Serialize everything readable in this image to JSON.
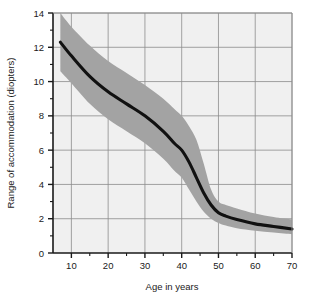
{
  "chart_data": {
    "type": "line",
    "title": "",
    "xlabel": "Age in years",
    "ylabel": "Range of accommodation (diopters)",
    "xlim": [
      5,
      70
    ],
    "ylim": [
      0,
      14
    ],
    "xticks": [
      10,
      20,
      30,
      40,
      50,
      60,
      70
    ],
    "xtick_labels": [
      "10",
      "20",
      "30",
      "40",
      "50",
      "60",
      "70"
    ],
    "xminor_ticks": [
      15,
      25,
      35,
      45,
      55,
      65
    ],
    "yticks": [
      0,
      2,
      4,
      6,
      8,
      10,
      12,
      14
    ],
    "ytick_labels": [
      "0",
      "2",
      "4",
      "6",
      "8",
      "10",
      "12",
      "14"
    ],
    "yminor_ticks": [
      1,
      3,
      5,
      7,
      9,
      11,
      13
    ],
    "grid": true,
    "legend": null,
    "series": [
      {
        "name": "Mean range of accommodation",
        "x": [
          7,
          10,
          15,
          20,
          25,
          30,
          35,
          38,
          40,
          42,
          44,
          46,
          48,
          50,
          52,
          55,
          60,
          65,
          70
        ],
        "values": [
          12.3,
          11.5,
          10.3,
          9.4,
          8.7,
          8.0,
          7.1,
          6.4,
          6.0,
          5.3,
          4.4,
          3.5,
          2.8,
          2.35,
          2.15,
          1.95,
          1.7,
          1.55,
          1.4
        ]
      }
    ],
    "band": {
      "name": "Range of normal variation",
      "x": [
        7,
        10,
        15,
        20,
        25,
        30,
        35,
        38,
        40,
        42,
        44,
        46,
        48,
        50,
        52,
        55,
        60,
        65,
        70
      ],
      "upper": [
        14.0,
        13.2,
        12.1,
        11.2,
        10.5,
        9.8,
        9.0,
        8.4,
        8.0,
        7.4,
        6.6,
        5.2,
        3.7,
        3.0,
        2.8,
        2.6,
        2.3,
        2.1,
        1.95
      ],
      "lower": [
        10.6,
        9.9,
        8.7,
        7.8,
        7.1,
        6.4,
        5.5,
        4.8,
        4.4,
        3.7,
        3.0,
        2.4,
        2.0,
        1.75,
        1.6,
        1.45,
        1.3,
        1.2,
        1.1
      ]
    },
    "colors": {
      "curve": "#111111",
      "band": "#a3a3a3",
      "plot_background": "#f0f0f0",
      "grid": "#8c8c8c",
      "axis": "#1a1a1a",
      "page_background": "#ffffff"
    }
  }
}
